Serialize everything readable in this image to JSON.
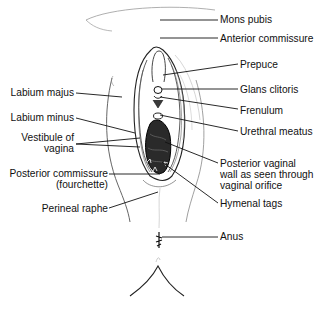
{
  "diagram": {
    "colors": {
      "ink": "#111111",
      "shade": "#2a2a2a",
      "sketch": "#9a9a9a",
      "background": "#ffffff"
    },
    "labels_right": [
      {
        "id": "mons-pubis",
        "text": "Mons pubis"
      },
      {
        "id": "anterior-commissure",
        "text": "Anterior commissure"
      },
      {
        "id": "prepuce",
        "text": "Prepuce"
      },
      {
        "id": "glans-clitoris",
        "text": "Glans clitoris"
      },
      {
        "id": "frenulum",
        "text": "Frenulum"
      },
      {
        "id": "urethral-meatus",
        "text": "Urethral meatus"
      },
      {
        "id": "posterior-vaginal-wall",
        "lines": [
          "Posterior vaginal",
          "wall as seen through",
          "vaginal orifice"
        ]
      },
      {
        "id": "hymenal-tags",
        "text": "Hymenal tags"
      },
      {
        "id": "anus",
        "text": "Anus"
      }
    ],
    "labels_left": [
      {
        "id": "labium-majus",
        "text": "Labium majus"
      },
      {
        "id": "labium-minus",
        "text": "Labium minus"
      },
      {
        "id": "vestibule-of-vagina",
        "lines": [
          "Vestibule of",
          "vagina"
        ]
      },
      {
        "id": "posterior-commissure",
        "lines": [
          "Posterior commissure",
          "(fourchette)"
        ]
      },
      {
        "id": "perineal-raphe",
        "text": "Perineal raphe"
      }
    ]
  }
}
